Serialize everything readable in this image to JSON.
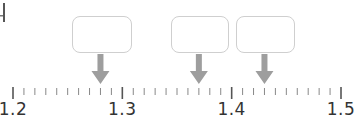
{
  "diagram": {
    "type": "number_line_with_answer_boxes",
    "axis": {
      "min": 1.2,
      "max": 1.5,
      "major_step": 0.1,
      "minor_step": 0.01,
      "pixel_start": 13,
      "pixel_end": 341,
      "labels": [
        {
          "value": 1.2,
          "text": "1.2"
        },
        {
          "value": 1.3,
          "text": "1.3"
        },
        {
          "value": 1.4,
          "text": "1.4"
        },
        {
          "value": 1.5,
          "text": "1.5"
        }
      ]
    },
    "answer_boxes": [
      {
        "id": "box-1",
        "points_to": 1.28,
        "left": 72,
        "width": 60,
        "content": ""
      },
      {
        "id": "box-2",
        "points_to": 1.37,
        "left": 171,
        "width": 58,
        "content": ""
      },
      {
        "id": "box-3",
        "points_to": 1.43,
        "left": 236,
        "width": 59,
        "content": ""
      }
    ],
    "colors": {
      "box_border": "#cfcfcf",
      "arrow": "#9e9e9e",
      "major_tick": "#555555",
      "minor_tick": "#888888",
      "label": "#333333"
    }
  }
}
